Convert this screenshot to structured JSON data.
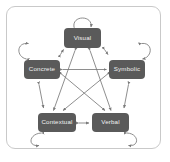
{
  "figure": {
    "title": "",
    "border_color": "#c9c9c9",
    "node_fill": "#5a5a5a",
    "node_text_color": "#f2f2f2",
    "edge_color": "#7a7a7a",
    "background": "#ffffff"
  },
  "nodes": [
    {
      "id": "visual",
      "label": "Visual",
      "position": "top"
    },
    {
      "id": "concrete",
      "label": "Concrete",
      "position": "left"
    },
    {
      "id": "symbolic",
      "label": "Symbolic",
      "position": "right"
    },
    {
      "id": "contextual",
      "label": "Contextual",
      "position": "bottom-left"
    },
    {
      "id": "verbal",
      "label": "Verbal",
      "position": "bottom-right"
    }
  ],
  "self_loops": [
    {
      "node": "visual",
      "placement": "above"
    },
    {
      "node": "concrete",
      "placement": "upper-left"
    },
    {
      "node": "symbolic",
      "placement": "upper-right"
    },
    {
      "node": "contextual",
      "placement": "lower-left"
    },
    {
      "node": "verbal",
      "placement": "lower-right"
    }
  ],
  "edges": [
    {
      "from": "visual",
      "to": "concrete",
      "type": "bidirectional",
      "route": "outer"
    },
    {
      "from": "visual",
      "to": "symbolic",
      "type": "bidirectional",
      "route": "outer"
    },
    {
      "from": "concrete",
      "to": "contextual",
      "type": "bidirectional",
      "route": "outer"
    },
    {
      "from": "symbolic",
      "to": "verbal",
      "type": "bidirectional",
      "route": "outer"
    },
    {
      "from": "contextual",
      "to": "verbal",
      "type": "bidirectional",
      "route": "outer"
    },
    {
      "from": "concrete",
      "to": "symbolic",
      "type": "bidirectional",
      "route": "chord"
    },
    {
      "from": "visual",
      "to": "contextual",
      "type": "bidirectional",
      "route": "chord"
    },
    {
      "from": "visual",
      "to": "verbal",
      "type": "bidirectional",
      "route": "chord"
    },
    {
      "from": "concrete",
      "to": "verbal",
      "type": "bidirectional",
      "route": "chord"
    },
    {
      "from": "symbolic",
      "to": "contextual",
      "type": "bidirectional",
      "route": "chord"
    }
  ]
}
